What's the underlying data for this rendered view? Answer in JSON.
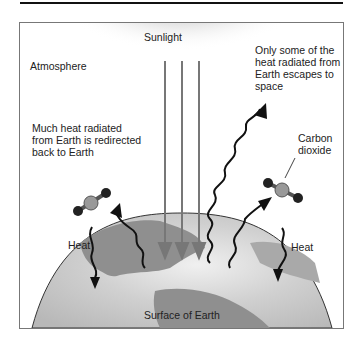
{
  "figure": {
    "labels": {
      "sunlight": "Sunlight",
      "atmosphere": "Atmosphere",
      "escape": "Only some of the\nheat radiated from\nEarth escapes to\nspace",
      "redirect": "Much heat radiated\nfrom Earth is redirected\nback to Earth",
      "carbon_dioxide": "Carbon\ndioxide",
      "heat_left": "Heat",
      "heat_right": "Heat",
      "surface": "Surface of Earth"
    },
    "colors": {
      "sun_glow": "#d9d9d9",
      "earth_ocean": "#c8c8c8",
      "land": "#8f8f8f",
      "arrows_sun": "#777777",
      "arrows_heat": "#111111",
      "frame_border": "#777777"
    }
  }
}
